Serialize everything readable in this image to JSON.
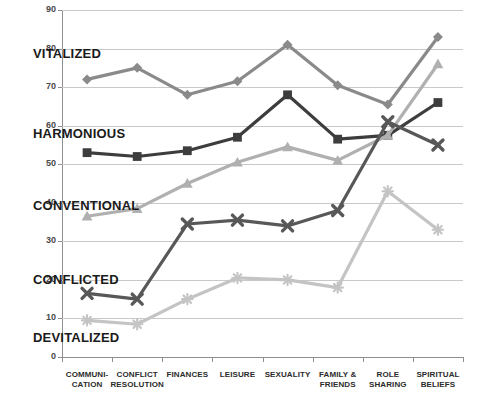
{
  "chart_data": {
    "type": "line",
    "title": "",
    "xlabel": "",
    "ylabel": "",
    "ylim": [
      0,
      90
    ],
    "ytick_step": 10,
    "yticks": [
      0,
      10,
      20,
      30,
      40,
      50,
      60,
      70,
      80,
      90
    ],
    "grid": true,
    "legend_position": "inline-labels",
    "categories": [
      "COMMUNI-\nCATION",
      "CONFLICT\nRESOLUTION",
      "FINANCES",
      "LEISURE",
      "SEXUALITY",
      "FAMILY &\nFRIENDS",
      "ROLE\nSHARING",
      "SPIRITUAL\nBELIEFS"
    ],
    "category_labels": [
      {
        "line1": "COMMUNI-",
        "line2": "CATION"
      },
      {
        "line1": "CONFLICT",
        "line2": "RESOLUTION"
      },
      {
        "line1": "FINANCES",
        "line2": ""
      },
      {
        "line1": "LEISURE",
        "line2": ""
      },
      {
        "line1": "SEXUALITY",
        "line2": ""
      },
      {
        "line1": "FAMILY &",
        "line2": "FRIENDS"
      },
      {
        "line1": "ROLE",
        "line2": "SHARING"
      },
      {
        "line1": "SPIRITUAL",
        "line2": "BELIEFS"
      }
    ],
    "series": [
      {
        "name": "VITALIZED",
        "color": "#8a8a8a",
        "marker": "diamond",
        "values": [
          72,
          75,
          68,
          71.5,
          81,
          70.5,
          65.5,
          83
        ]
      },
      {
        "name": "HARMONIOUS",
        "color": "#3d3d3d",
        "marker": "square",
        "values": [
          53,
          52,
          53.5,
          57,
          68,
          56.5,
          57.5,
          66
        ]
      },
      {
        "name": "CONVENTIONAL",
        "color": "#b0b0b0",
        "marker": "triangle",
        "values": [
          36.5,
          38.5,
          45,
          50.5,
          54.5,
          51,
          57.5,
          76
        ]
      },
      {
        "name": "CONFLICTED",
        "color": "#585858",
        "marker": "x",
        "values": [
          16.5,
          15,
          34.5,
          35.5,
          34,
          38,
          61,
          55
        ]
      },
      {
        "name": "DEVITALIZED",
        "color": "#c4c4c4",
        "marker": "star",
        "values": [
          9.5,
          8.5,
          15,
          20.5,
          20,
          18,
          43,
          33
        ]
      }
    ]
  },
  "series_labels": {
    "vitalized": "VITALIZED",
    "harmonious": "HARMONIOUS",
    "conventional": "CONVENTIONAL",
    "conflicted": "CONFLICTED",
    "devitalized": "DEVITALIZED"
  }
}
